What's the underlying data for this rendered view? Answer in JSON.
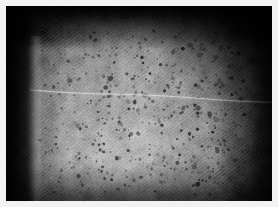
{
  "image": {
    "kind": "photograph",
    "subject": "grayscale macro photograph of skin surface showing dense pores and follicles",
    "width": 278,
    "height": 207,
    "border": {
      "name": "white photo border",
      "width_px": 6,
      "color": "#f2f2f0"
    },
    "canvas": {
      "x": 6,
      "y": 6,
      "width": 266,
      "height": 195
    },
    "palette": {
      "border_white": "#f2f2f0",
      "deep_black": "#070707",
      "shadow_dark": "#1c1c1c",
      "mid_shadow": "#4a4a4a",
      "base_gray": "#8e8e8e",
      "light_gray": "#a8a8a8",
      "highlight": "#c4c4c4",
      "speckle_dark": "#3a3a3a",
      "crease_line": "#d6d6d2"
    },
    "regions": [
      {
        "name": "top-dark-band",
        "description": "very dark horizontal vignette band across the top edge",
        "x": 0,
        "y": 0,
        "width": 266,
        "height": 30,
        "tone": "#0d0d0d"
      },
      {
        "name": "left-dark-column",
        "description": "near-black vertical band down the left side with faint diagonal hatching",
        "x": 0,
        "y": 0,
        "width": 26,
        "height": 195,
        "tone": "#0b0b0b"
      },
      {
        "name": "top-right-dark-corner",
        "description": "dark vignette corner at upper right",
        "x": 196,
        "y": 0,
        "width": 70,
        "height": 60,
        "tone": "#101010"
      },
      {
        "name": "right-dark-edge",
        "description": "darkening gradient along the right edge with diagonal hatch",
        "x": 226,
        "y": 40,
        "width": 40,
        "height": 155,
        "tone": "#2a2a2a"
      },
      {
        "name": "bottom-shadow",
        "description": "soft shadow along the bottom edge",
        "x": 0,
        "y": 168,
        "width": 266,
        "height": 27,
        "tone": "#565656"
      },
      {
        "name": "central-lit-field",
        "description": "main mid-gray illuminated skin surface filled with dark pore speckles",
        "x": 30,
        "y": 28,
        "width": 200,
        "height": 160,
        "tone": "#8e8e8e"
      },
      {
        "name": "lower-center-highlight",
        "description": "brightest specular area in the lower centre-left of the frame",
        "x": 85,
        "y": 120,
        "width": 95,
        "height": 65,
        "tone": "#bfbfbf"
      }
    ],
    "features": [
      {
        "name": "horizontal-crease-line",
        "description": "faint bright scratch / crease running left-to-right, sloping slightly downward",
        "x1": 24,
        "y1": 84,
        "x2": 266,
        "y2": 96,
        "color": "#d6d6d2",
        "thickness_px": 1
      },
      {
        "name": "left-edge-rim-light",
        "description": "thin bright vertical rim where the dark column meets the lit surface",
        "x1": 27,
        "y1": 30,
        "x2": 31,
        "y2": 195,
        "color": "#9a9a9a"
      },
      {
        "name": "diagonal-hatch-texture",
        "description": "fine diagonal hatching (film grain / fabric weave) across the whole frame",
        "angle_deg": 52,
        "spacing_px": 3
      },
      {
        "name": "pore-speckle-field",
        "description": "hundreds of small dark dots concentrated in the right half and centre",
        "approx_count": 520,
        "dot_size_px": [
          1,
          3
        ],
        "densest_zone": "right-of-centre, upper two thirds"
      }
    ]
  },
  "chart_data": {
    "type": "heatmap",
    "title": "",
    "xlabel": "",
    "ylabel": "",
    "x": [
      0,
      33,
      66,
      100,
      133,
      166,
      200,
      233,
      266
    ],
    "y": [
      0,
      24,
      49,
      73,
      98,
      122,
      146,
      171,
      195
    ],
    "values": [
      [
        10,
        14,
        20,
        26,
        30,
        26,
        20,
        14,
        10
      ],
      [
        10,
        40,
        86,
        112,
        120,
        112,
        90,
        46,
        16
      ],
      [
        12,
        96,
        140,
        150,
        152,
        148,
        132,
        80,
        26
      ],
      [
        14,
        120,
        152,
        158,
        160,
        156,
        142,
        96,
        36
      ],
      [
        16,
        128,
        158,
        164,
        166,
        160,
        146,
        102,
        42
      ],
      [
        18,
        134,
        166,
        176,
        178,
        166,
        148,
        100,
        40
      ],
      [
        20,
        130,
        170,
        186,
        184,
        168,
        144,
        92,
        36
      ],
      [
        22,
        112,
        150,
        164,
        162,
        148,
        124,
        76,
        30
      ],
      [
        24,
        70,
        96,
        108,
        106,
        96,
        80,
        50,
        22
      ]
    ],
    "grid": false,
    "legend": "none",
    "zlim": [
      0,
      255
    ]
  }
}
